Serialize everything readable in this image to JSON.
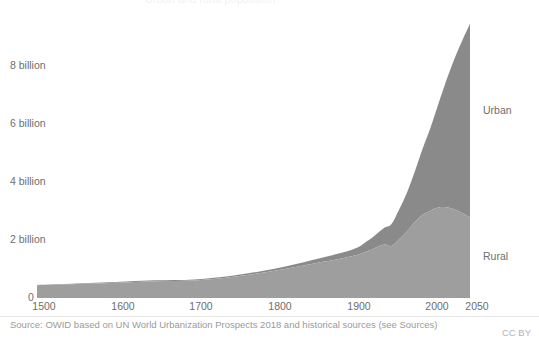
{
  "title": "Urban and rural population",
  "footer": {
    "source": "Source: OWID based on UN World Urbanization Prospects 2018 and historical sources (see Sources)",
    "license": "CC BY"
  },
  "axis": {
    "y_ticks": [
      "0",
      "2 billion",
      "4 billion",
      "6 billion",
      "8 billion"
    ],
    "x_ticks": [
      "1500",
      "1600",
      "1700",
      "1800",
      "1900",
      "2000",
      "2050"
    ]
  },
  "series_labels": {
    "urban": "Urban",
    "rural": "Rural"
  },
  "colors": {
    "urban": "#8a8a8a",
    "rural": "#9e9e9e",
    "text": "#6e6e6e",
    "muted_text": "#9a9a9a",
    "rule": "#e6e6e6"
  },
  "chart_data": {
    "type": "area",
    "stacked": true,
    "title": "Urban and rural population",
    "xlabel": "",
    "ylabel": "",
    "xlim": [
      1500,
      2050
    ],
    "ylim": [
      0,
      10
    ],
    "grid": false,
    "legend_position": "direct-labels-right",
    "units": "billion people",
    "x": [
      1500,
      1550,
      1600,
      1650,
      1700,
      1750,
      1800,
      1850,
      1900,
      1920,
      1940,
      1950,
      1960,
      1970,
      1980,
      1990,
      2000,
      2010,
      2020,
      2030,
      2040,
      2050
    ],
    "series": [
      {
        "name": "Rural",
        "stack_order": 1,
        "values": [
          0.44,
          0.48,
          0.53,
          0.58,
          0.6,
          0.73,
          0.93,
          1.18,
          1.44,
          1.62,
          1.84,
          1.79,
          2.03,
          2.29,
          2.62,
          2.87,
          3.02,
          3.12,
          3.13,
          3.06,
          2.93,
          2.78
        ]
      },
      {
        "name": "Urban",
        "stack_order": 2,
        "values": [
          0.01,
          0.02,
          0.02,
          0.03,
          0.04,
          0.05,
          0.07,
          0.13,
          0.22,
          0.35,
          0.56,
          0.75,
          1.02,
          1.35,
          1.75,
          2.29,
          2.87,
          3.59,
          4.38,
          5.17,
          5.94,
          6.68
        ]
      },
      {
        "name": "Total",
        "stack_order": 0,
        "derived": true,
        "values": [
          0.45,
          0.5,
          0.55,
          0.61,
          0.64,
          0.78,
          1.0,
          1.31,
          1.66,
          1.97,
          2.4,
          2.54,
          3.05,
          3.64,
          4.37,
          5.16,
          5.89,
          6.71,
          7.51,
          8.23,
          8.87,
          9.46
        ]
      }
    ],
    "annotations": [
      {
        "text": "Urban",
        "x": 2050,
        "y": 6.2
      },
      {
        "text": "Rural",
        "x": 2050,
        "y": 1.5
      }
    ]
  }
}
